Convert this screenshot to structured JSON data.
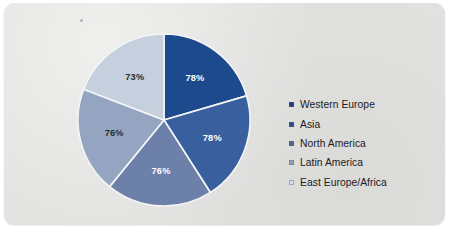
{
  "chart_data": {
    "type": "pie",
    "title": "",
    "xlabel": "",
    "ylabel": "",
    "categories": [
      "Western Europe",
      "Asia",
      "North America",
      "Latin America",
      "East Europe/Africa"
    ],
    "values": [
      78,
      78,
      76,
      76,
      73
    ],
    "data_labels": [
      "78%",
      "78%",
      "76%",
      "76%",
      "73%"
    ],
    "unit": "%",
    "start_angle_deg": 0,
    "direction": "clockwise",
    "legend_position": "right",
    "grid": false,
    "colors": [
      "#1d4a8c",
      "#3a5f9e",
      "#6c80a9",
      "#95a5c1",
      "#c5cfdd"
    ],
    "label_text_colors": [
      "#ffffff",
      "#ffffff",
      "#ffffff",
      "#2b2b33",
      "#2b2b33"
    ],
    "slices": [
      {
        "name": "Western Europe",
        "value": 78,
        "label": "78%",
        "color": "#1d4a8c",
        "label_color": "#ffffff"
      },
      {
        "name": "Asia",
        "value": 78,
        "label": "78%",
        "color": "#3a5f9e",
        "label_color": "#ffffff"
      },
      {
        "name": "North America",
        "value": 76,
        "label": "76%",
        "color": "#6c80a9",
        "label_color": "#ffffff"
      },
      {
        "name": "Latin America",
        "value": 76,
        "label": "76%",
        "color": "#95a5c1",
        "label_color": "#2b2b33"
      },
      {
        "name": "East Europe/Africa",
        "value": 73,
        "label": "73%",
        "color": "#c5cfdd",
        "label_color": "#2b2b33"
      }
    ]
  },
  "legend": {
    "items": [
      {
        "label": "Western Europe",
        "color": "#23387a"
      },
      {
        "label": "Asia",
        "color": "#2c4691"
      },
      {
        "label": "North America",
        "color": "#51658f"
      },
      {
        "label": "Latin America",
        "color": "#92a1b8"
      },
      {
        "label": "East Europe/Africa",
        "color": "#dadfe6"
      }
    ]
  },
  "panel": {
    "background_color": "#e2e2e0",
    "slice_border_color": "#f4f5f7"
  }
}
